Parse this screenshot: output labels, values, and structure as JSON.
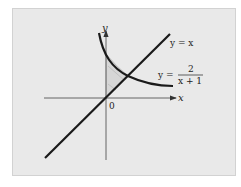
{
  "figure": {
    "axes": {
      "x_label": "x",
      "y_label": "y",
      "origin_label": "0"
    },
    "curves": [
      {
        "name": "line",
        "label": "y = x"
      },
      {
        "name": "hyperbola",
        "label_prefix": "y =",
        "numerator": "2",
        "denominator": "x + 1"
      }
    ],
    "shaded_region": "between x = 0, y = x and y = 2/(x+1)",
    "colors": {
      "background": "#e9e9e9",
      "curve": "#1a1a1a",
      "axis": "#555555",
      "shade": "#d4d4d4"
    }
  }
}
